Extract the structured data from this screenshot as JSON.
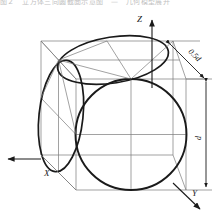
{
  "figure": {
    "title_strip": "图２　立方体三向圆截面示意图　—　几何模型展开",
    "background_color": "#ffffff",
    "line_color": "#1a1a1a",
    "construction_line_color": "#7a7a7a",
    "projection": "isometric-wireframe-cube"
  },
  "axes": [
    {
      "name": "x-axis",
      "label": "X",
      "direction": "left",
      "label_x": 47,
      "label_y": 172
    },
    {
      "name": "y-axis",
      "label": "Y",
      "direction": "down-right",
      "label_x": 196,
      "label_y": 198
    },
    {
      "name": "z-axis",
      "label": "Z",
      "direction": "up",
      "label_x": 137,
      "label_y": 22
    }
  ],
  "dimensions": [
    {
      "name": "half-diameter",
      "label": "0.5d",
      "orientation": "diagonal",
      "label_x": 188,
      "label_y": 52
    },
    {
      "name": "diameter",
      "label": "d",
      "orientation": "vertical",
      "label_x": 201,
      "label_y": 137
    }
  ],
  "shapes": {
    "cube": {
      "name": "wireframe-cube",
      "faces": 3
    },
    "circles": [
      {
        "name": "top-face-circle",
        "plane": "XY",
        "rendered_as": "ellipse"
      },
      {
        "name": "left-face-circle",
        "plane": "YZ",
        "rendered_as": "ellipse"
      },
      {
        "name": "front-face-circle",
        "plane": "XZ",
        "rendered_as": "circle"
      }
    ]
  }
}
